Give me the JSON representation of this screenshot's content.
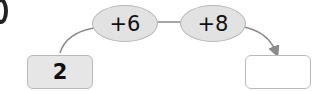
{
  "diagram": {
    "start_value": "2",
    "operations": [
      {
        "label": "+6"
      },
      {
        "label": "+8"
      }
    ],
    "result_value": "",
    "colors": {
      "ellipse_fill": "#e2e2e2",
      "start_box_fill": "#e6e6e6",
      "result_box_fill": "#ffffff",
      "connector": "#8a8a8a"
    }
  }
}
